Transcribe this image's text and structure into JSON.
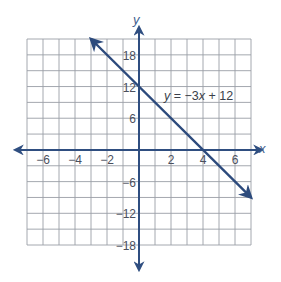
{
  "chart_data": {
    "type": "line",
    "title": "",
    "xlabel": "x",
    "ylabel": "y",
    "xlim": [
      -7,
      7
    ],
    "ylim": [
      -18,
      21
    ],
    "x_grid_step": 1,
    "y_grid_step": 3,
    "grid": true,
    "x_ticks": [
      -6,
      -4,
      -2,
      2,
      4,
      6
    ],
    "x_tick_labels": [
      "−6",
      "−4",
      "−2",
      "2",
      "4",
      "6"
    ],
    "y_ticks": [
      18,
      12,
      6,
      -6,
      -12,
      -18
    ],
    "y_tick_labels": [
      "18",
      "12",
      "6",
      "−6",
      "−12",
      "−18"
    ],
    "series": [
      {
        "name": "y = −3x + 12",
        "equation": {
          "slope": -3,
          "intercept": 12
        },
        "x": [
          -3,
          0,
          4,
          7
        ],
        "y": [
          21,
          12,
          0,
          -9
        ],
        "arrows": "both"
      }
    ],
    "annotations": [
      {
        "text": "y = −3x + 12",
        "x": 1.2,
        "y": 10.5
      }
    ],
    "colors": {
      "line": "#2c4a7c",
      "axis": "#2f4e80",
      "grid": "#9a9ea6",
      "text": "#4a4f5c"
    }
  },
  "labels": {
    "x_axis": "x",
    "y_axis": "y",
    "equation_lhs": "y",
    "equation_rhs": " = −3",
    "equation_x": "x",
    "equation_tail": " + 12"
  }
}
